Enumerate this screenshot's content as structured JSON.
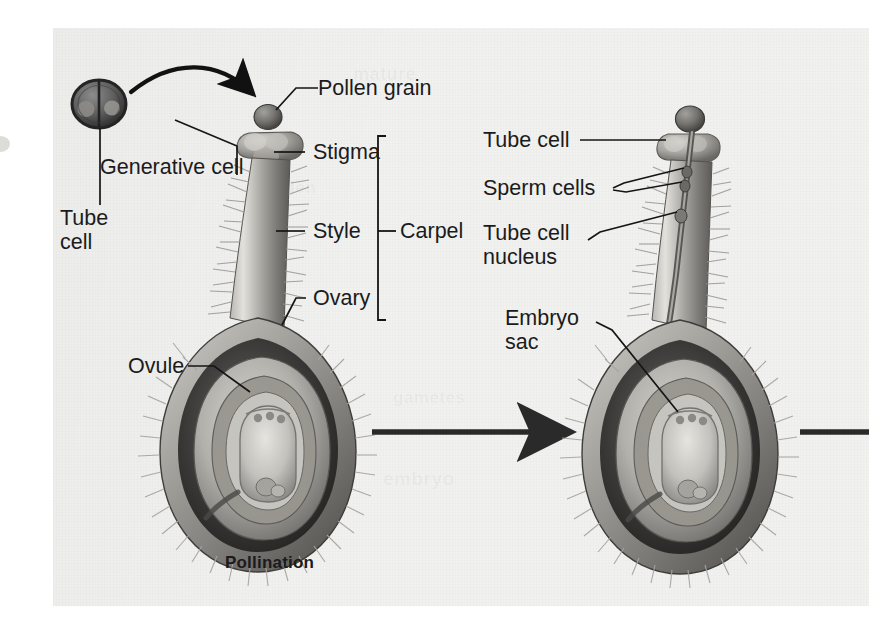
{
  "figure": {
    "title_visible": false,
    "kind": "botanical-diagram",
    "background_color": "#f1f1f0",
    "ink_color": "#1b1b1b",
    "page_color": "#ffffff"
  },
  "left_panel": {
    "caption": "Pollination",
    "labels": {
      "pollen_grain": "Pollen grain",
      "generative_cell": "Generative cell",
      "tube_cell": "Tube\ncell",
      "stigma": "Stigma",
      "style": "Style",
      "ovary": "Ovary",
      "ovule": "Ovule",
      "carpel": "Carpel"
    }
  },
  "right_panel": {
    "caption": "",
    "labels": {
      "tube_cell": "Tube cell",
      "sperm_cells": "Sperm cells",
      "tube_cell_nucleus": "Tube cell\nnucleus",
      "embryo_sac": "Embryo\nsac"
    }
  },
  "flow": {
    "arrow_1": "pollen-grain-to-stigma",
    "arrow_2": "pollination-to-tube-growth",
    "arrow_3": "tube-growth-to-fertilization"
  },
  "bleed_text": {
    "line_1": "mature",
    "line_2": "pollen",
    "line_3": "gametes",
    "line_4": "embryo"
  }
}
